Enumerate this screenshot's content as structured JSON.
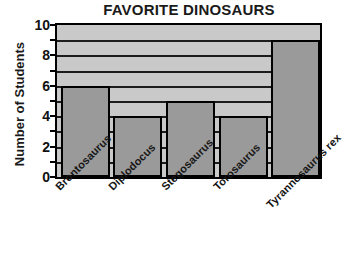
{
  "chart_data": {
    "type": "bar",
    "title": "FAVORITE DINOSAURS",
    "xlabel": "",
    "ylabel": "Number of Students",
    "categories": [
      "Brontosaurus",
      "Diplodocus",
      "Stegosaurus",
      "Torosaurus",
      "Tyrannosaurus rex"
    ],
    "values": [
      6,
      4,
      5,
      4,
      9
    ],
    "ylim": [
      0,
      10
    ],
    "ytick_labels": [
      "0",
      "2",
      "4",
      "6",
      "8",
      "10"
    ],
    "ytick_values": [
      0,
      2,
      4,
      6,
      8,
      10
    ],
    "minor_tick_values": [
      1,
      3,
      5,
      7,
      9
    ],
    "gridline_values": [
      1,
      2,
      3,
      4,
      5,
      6,
      7,
      8,
      9
    ],
    "grid": true,
    "legend": "none",
    "colors": {
      "bar_fill": "#9a9a9a",
      "bar_edge": "#000000",
      "plot_background": "#c9c9c9",
      "gridline": "#1c1c1c",
      "text": "#111111",
      "page_background": "#ffffff"
    }
  }
}
